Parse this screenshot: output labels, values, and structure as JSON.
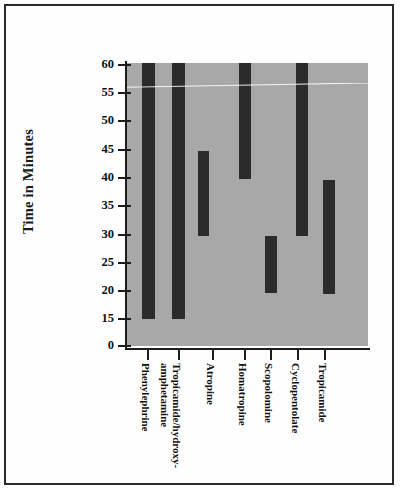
{
  "chart_data": {
    "type": "bar",
    "title": "",
    "subtitle": "",
    "xlabel": "",
    "ylabel": "Time in Minutes",
    "orientation": "vertical",
    "bar_style": "floating-range",
    "grid": false,
    "legend": null,
    "plot_background_color": "#a9a9a9",
    "bar_color": "#2b2b2b",
    "axis_color": "#1c1c1c",
    "ylim": [
      0,
      60
    ],
    "y_axis_broken": true,
    "y_axis_break_note": "axis jumps from 0 directly to 15",
    "y_ticks": [
      0,
      15,
      20,
      25,
      30,
      35,
      40,
      45,
      50,
      55,
      60
    ],
    "y_tick_labels": [
      "0",
      "15",
      "20",
      "25",
      "30",
      "35",
      "40",
      "45",
      "50",
      "55",
      "60"
    ],
    "categories": [
      "Phenylephrine",
      "Tropicamide/hydroxy-amphetamine",
      "Atropine",
      "Homatropine",
      "Scopolomine",
      "Cyclopentolate",
      "Tropicamide"
    ],
    "category_label_lines": [
      [
        "Phenylephrine"
      ],
      [
        "Tropicamide/hydroxy-",
        "amphetamine"
      ],
      [
        "Atropine"
      ],
      [
        "Homatropine"
      ],
      [
        "Scopolomine"
      ],
      [
        "Cyclopentolate"
      ],
      [
        "Tropicamide"
      ]
    ],
    "series": [
      {
        "name": "Time range (minutes)",
        "low": [
          15,
          15,
          30,
          40,
          20,
          30,
          20
        ],
        "high": [
          60,
          60,
          45,
          60,
          30,
          60,
          39.5
        ],
        "clipped_at_top": [
          true,
          true,
          false,
          true,
          false,
          true,
          false
        ]
      }
    ]
  },
  "bars": [
    {
      "name": "Phenylephrine",
      "left": 16,
      "width": 13,
      "top": 0,
      "height": 256
    },
    {
      "name": "Tropicamide/hydroxy-amphetamine",
      "left": 46,
      "width": 13,
      "top": 0,
      "height": 256
    },
    {
      "name": "Atropine",
      "left": 72,
      "width": 11,
      "top": 88,
      "height": 85
    },
    {
      "name": "Homatropine",
      "left": 113,
      "width": 12,
      "top": 0,
      "height": 116
    },
    {
      "name": "Scopolomine",
      "left": 139,
      "width": 12,
      "top": 173,
      "height": 57
    },
    {
      "name": "Cyclopentolate",
      "left": 170,
      "width": 12,
      "top": 0,
      "height": 173
    },
    {
      "name": "Tropicamide",
      "left": 197,
      "width": 12,
      "top": 117,
      "height": 114
    }
  ],
  "y_ticks_px": [
    {
      "label": "60",
      "y": 58
    },
    {
      "label": "55",
      "y": 86
    },
    {
      "label": "50",
      "y": 114
    },
    {
      "label": "45",
      "y": 143
    },
    {
      "label": "40",
      "y": 171
    },
    {
      "label": "35",
      "y": 199
    },
    {
      "label": "30",
      "y": 228
    },
    {
      "label": "25",
      "y": 256
    },
    {
      "label": "20",
      "y": 284
    },
    {
      "label": "15",
      "y": 312
    },
    {
      "label": "0",
      "y": 339
    }
  ],
  "x_ticks_px": [
    {
      "label": "Phenylephrine",
      "line1": "Phenylephrine",
      "line2": "",
      "x": 141
    },
    {
      "label": "Tropicamide/hydroxy-amphetamine",
      "line1": "Tropicamide/hydroxy-",
      "line2": "amphetamine",
      "x": 172
    },
    {
      "label": "Atropine",
      "line1": "Atropine",
      "line2": "",
      "x": 206
    },
    {
      "label": "Homatropine",
      "line1": "Homatropine",
      "line2": "",
      "x": 238
    },
    {
      "label": "Scopolomine",
      "line1": "Scopolomine",
      "line2": "",
      "x": 264
    },
    {
      "label": "Cyclopentolate",
      "line1": "Cyclopentolate",
      "line2": "",
      "x": 291
    },
    {
      "label": "Tropicamide",
      "line1": "Tropicamide",
      "line2": "",
      "x": 318
    }
  ]
}
